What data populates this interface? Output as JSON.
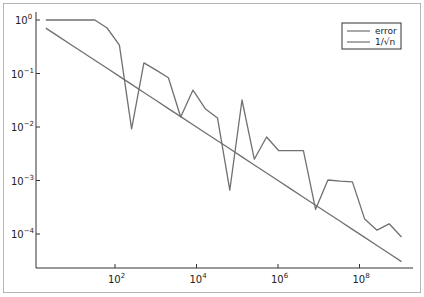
{
  "chart_data": {
    "type": "line",
    "title": "",
    "xlabel": "",
    "ylabel": "",
    "xscale": "log",
    "yscale": "log",
    "xlim": [
      1.15,
      3000000000.0
    ],
    "ylim": [
      2.7e-05,
      1.4
    ],
    "grid": false,
    "legend_position": "top-right",
    "x_ticks": [
      {
        "value": 100,
        "label": "10",
        "exp": "2"
      },
      {
        "value": 10000,
        "label": "10",
        "exp": "4"
      },
      {
        "value": 1000000,
        "label": "10",
        "exp": "6"
      },
      {
        "value": 100000000,
        "label": "10",
        "exp": "8"
      }
    ],
    "y_ticks": [
      {
        "value": 1,
        "label": "10",
        "exp": "0"
      },
      {
        "value": 0.1,
        "label": "10",
        "exp": "−1"
      },
      {
        "value": 0.01,
        "label": "10",
        "exp": "−2"
      },
      {
        "value": 0.001,
        "label": "10",
        "exp": "−3"
      },
      {
        "value": 0.0001,
        "label": "10",
        "exp": "−4"
      }
    ],
    "x": [
      2,
      4,
      8,
      16,
      32,
      64,
      128,
      256,
      512,
      1024,
      2048,
      4096,
      8192,
      16384,
      32768,
      65536,
      131072,
      262144,
      524288,
      1048576,
      2097152,
      4194304,
      8388608,
      16777216,
      33554432,
      67108864,
      134217728,
      268435456,
      536870912,
      1073741824
    ],
    "series": [
      {
        "name": "error",
        "color": "#707070",
        "values": [
          1.0,
          1.0,
          1.0,
          1.0,
          1.0,
          0.71,
          0.34,
          0.0092,
          0.158,
          0.116,
          0.083,
          0.0154,
          0.049,
          0.022,
          0.0148,
          0.00066,
          0.032,
          0.0025,
          0.0065,
          0.0036,
          0.0036,
          0.0036,
          0.00029,
          0.00102,
          0.00097,
          0.00094,
          0.00019,
          0.000118,
          0.000155,
          8.8e-05
        ]
      },
      {
        "name": "1/√n",
        "color": "#707070",
        "formula": "1/sqrt(n)",
        "values": [
          0.7071,
          0.5,
          0.3536,
          0.25,
          0.1768,
          0.125,
          0.0884,
          0.0625,
          0.0442,
          0.03125,
          0.0221,
          0.01563,
          0.01105,
          0.00781,
          0.00552,
          0.00391,
          0.00276,
          0.00195,
          0.00138,
          0.000977,
          0.000691,
          0.000488,
          0.000345,
          0.000244,
          0.000173,
          0.000122,
          8.63e-05,
          6.1e-05,
          4.32e-05,
          3.05e-05
        ]
      }
    ]
  },
  "legend": {
    "items": [
      {
        "label": "error"
      },
      {
        "label": "1/√n"
      }
    ]
  }
}
